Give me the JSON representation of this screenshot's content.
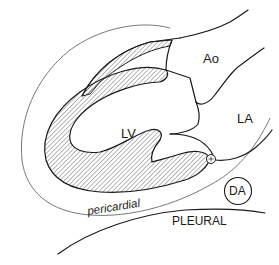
{
  "diagram": {
    "type": "anatomical-cross-section",
    "labels": {
      "aorta": "Ao",
      "left_atrium": "LA",
      "left_ventricle": "LV",
      "descending_aorta": "DA",
      "pericardial": "pericardial",
      "pleural": "PLEURAL"
    },
    "markers": {
      "small_circle": "coronary-sinus-marker"
    },
    "colors": {
      "line": "#1a1a1a",
      "thin_line": "#555555",
      "hatch": "#333333",
      "background": "#ffffff"
    }
  }
}
